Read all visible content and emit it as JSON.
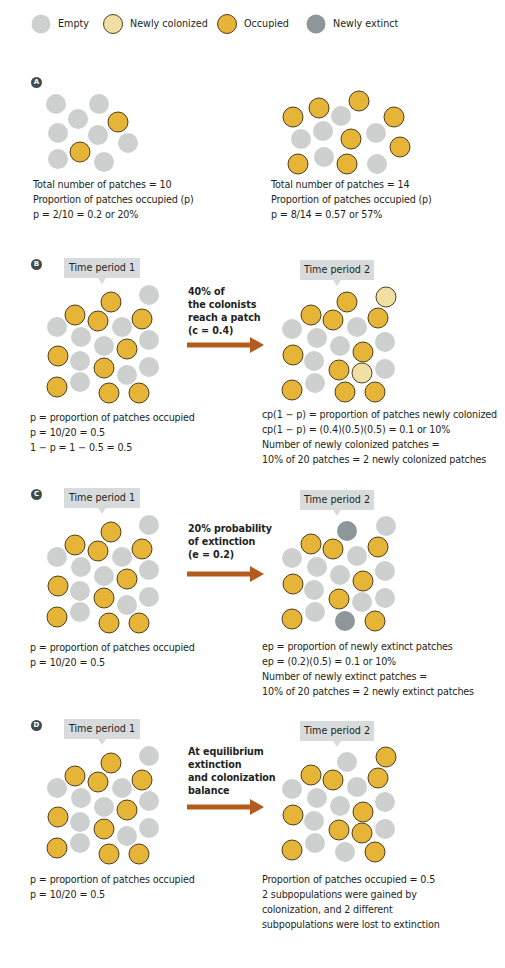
{
  "colors": {
    "empty": "#cdd0cf",
    "newly_colonized": "#f4e3a8",
    "occupied": "#e6b436",
    "occupied_stroke": "#3a2e10",
    "newly_extinct": "#8d9799",
    "arrow": "#b35a1f",
    "label_box": "#d8dbdb",
    "badge": "#3f4c4f"
  },
  "legend": {
    "items": [
      {
        "key": "empty",
        "label": "Empty"
      },
      {
        "key": "newly_colonized",
        "label": "Newly colonized"
      },
      {
        "key": "occupied",
        "label": "Occupied"
      },
      {
        "key": "newly_extinct",
        "label": "Newly extinct"
      }
    ]
  },
  "panels": {
    "A": {
      "badge": "A",
      "left": {
        "lines": [
          "Total number of patches = 10",
          "Proportion of patches occupied (p)",
          "p = 2/10 = 0.2 or 20%"
        ]
      },
      "right": {
        "lines": [
          "Total number of patches = 14",
          "Proportion of patches occupied (p)",
          "p = 8/14 = 0.57 or 57%"
        ]
      }
    },
    "B": {
      "badge": "B",
      "t1_label": "Time period 1",
      "t2_label": "Time period 2",
      "arrow_text": [
        "40% of",
        "the colonists",
        "reach a patch",
        "(c = 0.4)"
      ],
      "left_lines": [
        "p = proportion of patches occupied",
        "p = 10/20 = 0.5",
        "1 − p = 1 − 0.5 = 0.5"
      ],
      "right_lines": [
        "cp(1 − p) = proportion of patches newly colonized",
        "cp(1 − p) = (0.4)(0.5)(0.5) = 0.1 or 10%",
        "Number of newly colonized patches =",
        "10% of 20 patches = 2 newly colonized patches"
      ]
    },
    "C": {
      "badge": "C",
      "t1_label": "Time period 1",
      "t2_label": "Time period 2",
      "arrow_text": [
        "20% probability",
        "of extinction",
        "(e = 0.2)"
      ],
      "left_lines": [
        "p = proportion of patches occupied",
        "p = 10/20 = 0.5"
      ],
      "right_lines": [
        "ep = proportion of newly extinct patches",
        "ep = (0.2)(0.5) = 0.1 or 10%",
        "Number of newly extinct patches =",
        "10% of 20 patches = 2 newly extinct patches"
      ]
    },
    "D": {
      "badge": "D",
      "t1_label": "Time period 1",
      "t2_label": "Time period 2",
      "arrow_text": [
        "At equilibrium",
        "extinction",
        "and colonization",
        "balance"
      ],
      "left_lines": [
        "p = proportion of patches occupied",
        "p = 10/20 = 0.5"
      ],
      "right_lines": [
        "Proportion of patches occupied = 0.5",
        "2 subpopulations were gained by",
        "colonization, and 2 different",
        "subpopulations were lost to extinction"
      ]
    }
  },
  "patches": {
    "A_left": [
      [
        56,
        104,
        "e"
      ],
      [
        99,
        104,
        "e"
      ],
      [
        78,
        119,
        "e"
      ],
      [
        118,
        122,
        "o"
      ],
      [
        58,
        133,
        "e"
      ],
      [
        98,
        135,
        "e"
      ],
      [
        128,
        143,
        "e"
      ],
      [
        80,
        152,
        "o"
      ],
      [
        58,
        159,
        "e"
      ],
      [
        104,
        162,
        "e"
      ]
    ],
    "A_right": [
      [
        293,
        117,
        "o"
      ],
      [
        319,
        108,
        "o"
      ],
      [
        359,
        101,
        "o"
      ],
      [
        341,
        116,
        "e"
      ],
      [
        394,
        117,
        "o"
      ],
      [
        301,
        139,
        "e"
      ],
      [
        323,
        131,
        "e"
      ],
      [
        351,
        139,
        "o"
      ],
      [
        376,
        133,
        "e"
      ],
      [
        400,
        147,
        "o"
      ],
      [
        298,
        164,
        "o"
      ],
      [
        324,
        157,
        "e"
      ],
      [
        347,
        164,
        "o"
      ],
      [
        377,
        164,
        "e"
      ]
    ],
    "B_t1": [
      [
        111,
        302,
        "o"
      ],
      [
        149,
        295,
        "e"
      ],
      [
        75,
        315,
        "o"
      ],
      [
        98,
        321,
        "o"
      ],
      [
        142,
        319,
        "o"
      ],
      [
        57,
        327,
        "e"
      ],
      [
        122,
        327,
        "e"
      ],
      [
        81,
        337,
        "e"
      ],
      [
        104,
        346,
        "e"
      ],
      [
        149,
        340,
        "e"
      ],
      [
        127,
        349,
        "o"
      ],
      [
        58,
        356,
        "o"
      ],
      [
        80,
        361,
        "e"
      ],
      [
        104,
        368,
        "o"
      ],
      [
        127,
        375,
        "e"
      ],
      [
        149,
        367,
        "e"
      ],
      [
        57,
        387,
        "o"
      ],
      [
        80,
        382,
        "e"
      ],
      [
        109,
        393,
        "o"
      ],
      [
        139,
        393,
        "o"
      ]
    ],
    "B_t2": [
      [
        347,
        302,
        "o"
      ],
      [
        386,
        297,
        "n"
      ],
      [
        311,
        315,
        "o"
      ],
      [
        333,
        320,
        "o"
      ],
      [
        378,
        318,
        "o"
      ],
      [
        292,
        329,
        "e"
      ],
      [
        357,
        327,
        "e"
      ],
      [
        317,
        338,
        "e"
      ],
      [
        340,
        346,
        "e"
      ],
      [
        385,
        342,
        "e"
      ],
      [
        363,
        352,
        "o"
      ],
      [
        293,
        355,
        "o"
      ],
      [
        314,
        361,
        "e"
      ],
      [
        339,
        370,
        "o"
      ],
      [
        362,
        373,
        "n"
      ],
      [
        385,
        369,
        "e"
      ],
      [
        292,
        390,
        "o"
      ],
      [
        315,
        383,
        "e"
      ],
      [
        345,
        392,
        "o"
      ],
      [
        375,
        392,
        "o"
      ]
    ],
    "C_t2_states": [
      "x",
      "e",
      "o",
      "o",
      "o",
      "e",
      "e",
      "e",
      "e",
      "e",
      "o",
      "o",
      "e",
      "o",
      "e",
      "e",
      "o",
      "e",
      "x",
      "o"
    ],
    "D_t2_states": [
      "e",
      "o",
      "o",
      "o",
      "o",
      "e",
      "e",
      "e",
      "e",
      "e",
      "o",
      "o",
      "e",
      "o",
      "o",
      "e",
      "o",
      "e",
      "e",
      "o"
    ]
  },
  "layout": {
    "C_offset": 230,
    "D_offset": 461
  }
}
